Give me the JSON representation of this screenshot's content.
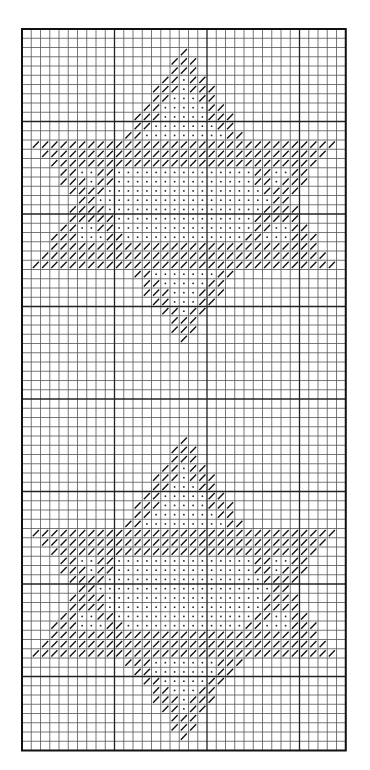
{
  "chart_data": {
    "type": "needlepoint-grid-chart",
    "title": "",
    "grid": {
      "columns": 35,
      "rows": 78,
      "origin_x": 22,
      "origin_y": 29,
      "cell_size": 9.25,
      "major_line_every": 10,
      "line_color": "#555555",
      "major_line_color": "#222222",
      "border_color": "#111111"
    },
    "symbols": {
      "outline_stitch": "diagonal-slash",
      "fill_stitch": "dot"
    },
    "motifs": [
      {
        "name": "star-1",
        "shape": "six-pointed-star",
        "center_col": 17,
        "up_triangle": {
          "apex_row": 2,
          "base_row": 25,
          "base_left_col": 1,
          "base_right_col": 33
        },
        "down_triangle": {
          "base_row": 12,
          "apex_row": 33,
          "base_left_col": 1,
          "base_right_col": 33
        }
      },
      {
        "name": "star-2",
        "shape": "six-pointed-star",
        "center_col": 17,
        "up_triangle": {
          "apex_row": 44,
          "base_row": 67,
          "base_left_col": 1,
          "base_right_col": 33
        },
        "down_triangle": {
          "base_row": 54,
          "apex_row": 76,
          "base_left_col": 1,
          "base_right_col": 33
        }
      }
    ],
    "outline_thickness_cells": 3
  }
}
